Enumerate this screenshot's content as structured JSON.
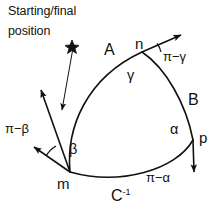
{
  "figure": {
    "background_color": "#ffffff",
    "stroke_color": "#111111",
    "caption_line1": "Starting/final",
    "caption_line2": "position",
    "vertices": {
      "m": "m",
      "n": "n",
      "p": "p"
    },
    "arcs": {
      "a": "A",
      "b": "B",
      "c_base": "C",
      "c_exponent": "-1"
    },
    "interior_angles": {
      "alpha": "α",
      "beta": "β",
      "gamma": "γ"
    },
    "exterior_angles": {
      "pi_minus_alpha": "π−α",
      "pi_minus_beta": "π−β",
      "pi_minus_gamma": "π−γ"
    },
    "markers": {
      "start_marker": "star-marker"
    }
  }
}
